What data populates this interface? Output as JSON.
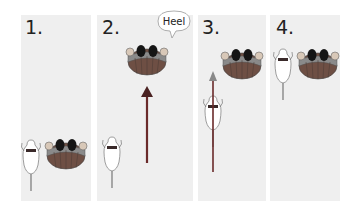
{
  "panels": [
    {
      "label": "1."
    },
    {
      "label": "2."
    },
    {
      "label": "3."
    },
    {
      "label": "4."
    }
  ],
  "speech_bubble": {
    "text": "Heel"
  },
  "colors": {
    "panel_bg": "#efefef",
    "person_body": "#7a5a4a",
    "person_hair": "#1a1a1a",
    "arrow": "#6a2a2a",
    "arrow_light": "#9a9a9a",
    "dog_fill": "#ffffff"
  }
}
